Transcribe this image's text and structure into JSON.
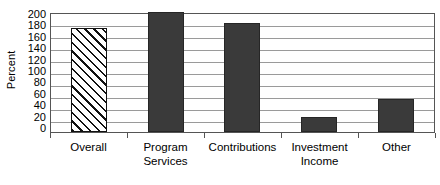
{
  "chart_data": {
    "type": "bar",
    "title": "",
    "subtitle": "",
    "xlabel": "",
    "ylabel": "Percent",
    "ylim": [
      0,
      200
    ],
    "ytick_step": 20,
    "yticks": [
      200,
      180,
      160,
      140,
      120,
      100,
      80,
      60,
      40,
      20,
      0
    ],
    "ytick_labels": [
      "200",
      "180",
      "160",
      "140",
      "120",
      "100",
      "80",
      "60",
      "40",
      "20",
      "0"
    ],
    "grid": "horizontal",
    "legend": "none",
    "categories": [
      "Overall",
      "Program Services",
      "Contributions",
      "Investment Income",
      "Other"
    ],
    "category_label_lines": [
      [
        "Overall"
      ],
      [
        "Program",
        "Services"
      ],
      [
        "Contributions"
      ],
      [
        "Investment",
        "Income"
      ],
      [
        "Other"
      ]
    ],
    "values": [
      173,
      200,
      182,
      25,
      55
    ],
    "bar_styles": [
      "hatched",
      "solid",
      "solid",
      "solid",
      "solid"
    ],
    "colors": {
      "bar_solid_fill": "#3a3a3a",
      "bar_solid_border": "#262626",
      "bar_hatched_fill": "#ffffff",
      "bar_hatched_line": "#111111",
      "gridline": "#9a9a9a",
      "axis_frame": "#555555",
      "text": "#000000",
      "background": "#ffffff"
    }
  }
}
